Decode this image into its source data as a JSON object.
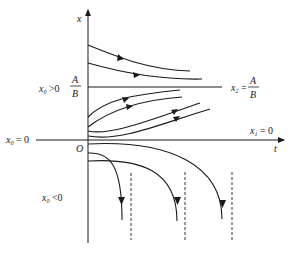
{
  "diagram": {
    "type": "solution-curves",
    "axes": {
      "vertical_label": "x",
      "horizontal_label": "t",
      "origin_label": "O"
    },
    "labels": {
      "x0_positive": "x",
      "x0_positive_sub": "0",
      "x0_positive_rel": " >0",
      "ab_num": "A",
      "ab_den": "B",
      "x0_zero": "x",
      "x0_zero_sub": "0",
      "x0_zero_rel": " = 0",
      "x0_negative": "x",
      "x0_negative_sub": "0",
      "x0_negative_rel": " <0",
      "x2": "x",
      "x2_sub": "2",
      "x2_eq": " =",
      "x2_num": "A",
      "x2_den": "B",
      "x1": "x",
      "x1_sub": "1",
      "x1_rel": " = 0"
    },
    "equilibria": [
      {
        "name": "x2",
        "value": "A/B",
        "stable": true
      },
      {
        "name": "x1",
        "value": "0",
        "stable": false
      }
    ],
    "regions": [
      {
        "initial": "x0 > A/B",
        "behavior": "decreasing to A/B",
        "curves": 2
      },
      {
        "initial": "0 < x0 < A/B",
        "behavior": "increasing to A/B",
        "curves": 4
      },
      {
        "initial": "x0 < 0",
        "behavior": "diverging to -infinity (finite time blow-up)",
        "curves": 3,
        "asymptotes": 3
      }
    ]
  }
}
